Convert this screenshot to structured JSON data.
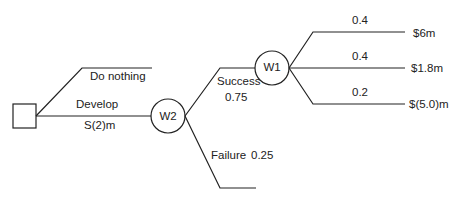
{
  "diagram": {
    "type": "decision-tree",
    "decision_node": {
      "shape": "square",
      "label": ""
    },
    "branches": {
      "do_nothing": {
        "label": "Do nothing"
      },
      "develop": {
        "label": "Develop",
        "cost": "S(2)m"
      }
    },
    "chance_nodes": {
      "w2": {
        "label": "W2"
      },
      "w1": {
        "label": "W1"
      }
    },
    "w2_outcomes": {
      "success": {
        "label": "Success",
        "probability": "0.75"
      },
      "failure": {
        "label": "Failure",
        "probability": "0.25"
      }
    },
    "w1_outcomes": [
      {
        "probability": "0.4",
        "payoff": "$6m"
      },
      {
        "probability": "0.4",
        "payoff": "$1.8m"
      },
      {
        "probability": "0.2",
        "payoff": "$(5.0)m"
      }
    ],
    "colors": {
      "line": "#222222",
      "text": "#222222",
      "background": "#ffffff"
    }
  }
}
